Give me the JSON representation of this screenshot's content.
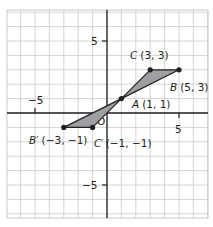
{
  "chart_data": {
    "type": "scatter",
    "title": "",
    "xlabel": "",
    "ylabel": "",
    "xlim": [
      -7,
      7
    ],
    "ylim": [
      -7,
      7
    ],
    "grid": true,
    "tick_labels": {
      "x": [
        {
          "value": -5,
          "label": "−5"
        },
        {
          "value": 5,
          "label": "5"
        }
      ],
      "y": [
        {
          "value": 5,
          "label": "5"
        },
        {
          "value": -5,
          "label": "−5"
        }
      ],
      "origin": "O"
    },
    "points": [
      {
        "name": "A",
        "x": 1,
        "y": 1,
        "label": "A (1, 1)"
      },
      {
        "name": "B",
        "x": 5,
        "y": 3,
        "label": "B (5, 3)"
      },
      {
        "name": "C",
        "x": 3,
        "y": 3,
        "label": "C (3, 3)"
      },
      {
        "name": "B'",
        "x": -3,
        "y": -1,
        "label": "B′ (−3, −1)"
      },
      {
        "name": "C'",
        "x": -1,
        "y": -1,
        "label": "C′ (−1, −1)"
      }
    ],
    "polygons": [
      {
        "name": "triangle-ABC",
        "vertices": [
          "A",
          "B",
          "C"
        ],
        "fill": "#9d9fa2"
      },
      {
        "name": "triangle-AB'C'",
        "vertices": [
          "A",
          "B'",
          "C'"
        ],
        "fill": "#9d9fa2"
      }
    ]
  },
  "colors": {
    "grid": "#c8c9cb",
    "axis": "#231f20",
    "fill": "#9d9fa2",
    "stroke": "#231f20",
    "point": "#231f20"
  },
  "labels": {
    "C": {
      "letter": "C",
      "coords": "(3, 3)"
    },
    "B": {
      "letter": "B",
      "coords": "(5, 3)"
    },
    "A": {
      "letter": "A",
      "coords": "(1, 1)"
    },
    "Bp": {
      "letter": "B′",
      "coords": "(−3, −1)"
    },
    "Cp": {
      "letter": "C′",
      "coords": "(−1, −1)"
    },
    "x_neg5": "−5",
    "x_pos5": "5",
    "y_pos5": "5",
    "y_neg5": "−5",
    "origin": "O"
  }
}
